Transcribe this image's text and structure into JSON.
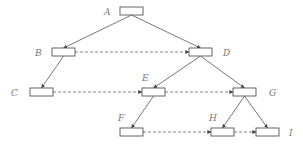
{
  "diagram": {
    "type": "tree-with-level-links",
    "colors": {
      "stroke": "#555555",
      "dashed": "#666666",
      "label": "#777777",
      "background": "#ffffff"
    },
    "nodes": [
      {
        "id": "A",
        "label": "A",
        "x": 120,
        "y": 7,
        "lx": 104,
        "ly": 15
      },
      {
        "id": "B",
        "label": "B",
        "x": 52,
        "y": 48,
        "lx": 35,
        "ly": 56
      },
      {
        "id": "D",
        "label": "D",
        "x": 189,
        "y": 48,
        "lx": 223,
        "ly": 56
      },
      {
        "id": "C",
        "label": "C",
        "x": 30,
        "y": 88,
        "lx": 11,
        "ly": 96
      },
      {
        "id": "E",
        "label": "E",
        "x": 142,
        "y": 88,
        "lx": 142,
        "ly": 81
      },
      {
        "id": "G",
        "label": "G",
        "x": 233,
        "y": 88,
        "lx": 269,
        "ly": 96
      },
      {
        "id": "F",
        "label": "F",
        "x": 120,
        "y": 128,
        "lx": 118,
        "ly": 121
      },
      {
        "id": "H",
        "label": "H",
        "x": 211,
        "y": 128,
        "lx": 209,
        "ly": 121
      },
      {
        "id": "I",
        "label": "I",
        "x": 256,
        "y": 128,
        "lx": 289,
        "ly": 136
      }
    ],
    "tree_edges": [
      [
        "A",
        "B"
      ],
      [
        "A",
        "D"
      ],
      [
        "B",
        "C"
      ],
      [
        "D",
        "E"
      ],
      [
        "D",
        "G"
      ],
      [
        "E",
        "F"
      ],
      [
        "G",
        "H"
      ],
      [
        "G",
        "I"
      ]
    ],
    "level_links": [
      [
        "B",
        "D"
      ],
      [
        "C",
        "E"
      ],
      [
        "E",
        "G"
      ],
      [
        "F",
        "H"
      ],
      [
        "H",
        "I"
      ]
    ]
  }
}
